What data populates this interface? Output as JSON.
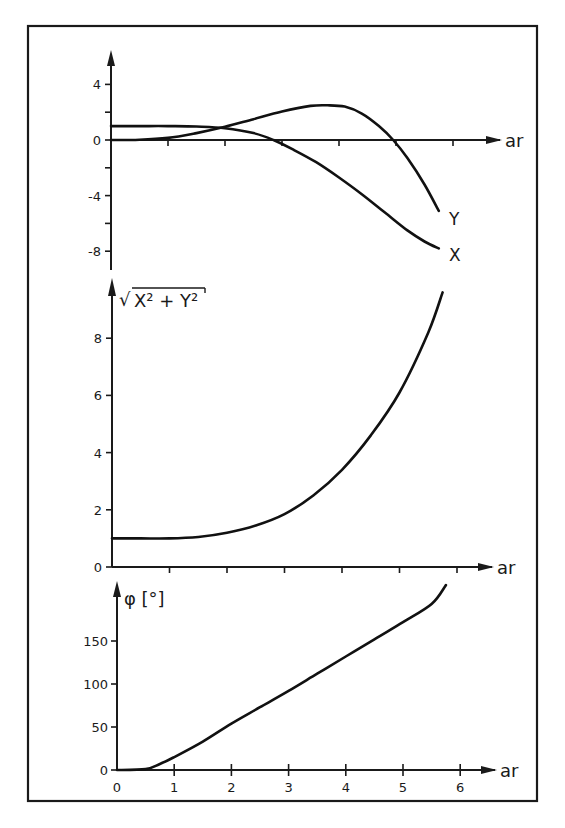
{
  "chart_data": [
    {
      "type": "line",
      "panel": "top",
      "title": "",
      "xlabel": "ar",
      "ylabel": "",
      "xlim": [
        0,
        6.5
      ],
      "ylim": [
        -9,
        5.5
      ],
      "x_ticks": [
        1,
        2,
        3,
        4,
        5,
        6
      ],
      "y_ticks": [
        4,
        2,
        0,
        -2,
        -4,
        -6,
        -8
      ],
      "y_tick_labels": [
        "4",
        "0",
        "-4",
        "-8"
      ],
      "grid": false,
      "series": [
        {
          "name": "X",
          "x": [
            0,
            0.5,
            1.0,
            1.5,
            2.0,
            2.5,
            2.85,
            3.2,
            3.6,
            4.0,
            4.4,
            4.8,
            5.2,
            5.5,
            5.75
          ],
          "values": [
            1.0,
            1.0,
            1.0,
            0.97,
            0.85,
            0.5,
            0.0,
            -0.7,
            -1.6,
            -2.7,
            -3.9,
            -5.2,
            -6.5,
            -7.3,
            -7.8
          ]
        },
        {
          "name": "Y",
          "x": [
            0,
            0.5,
            1.0,
            1.5,
            2.0,
            2.5,
            3.0,
            3.5,
            3.8,
            4.1,
            4.4,
            4.7,
            4.95,
            5.2,
            5.5,
            5.75
          ],
          "values": [
            0.0,
            0.02,
            0.15,
            0.5,
            0.95,
            1.5,
            2.05,
            2.45,
            2.5,
            2.4,
            1.9,
            1.0,
            0.0,
            -1.3,
            -3.2,
            -5.1
          ]
        }
      ]
    },
    {
      "type": "line",
      "panel": "middle",
      "title": "",
      "xlabel": "ar",
      "ylabel": "√(X² + Y²)",
      "xlim": [
        0,
        6.5
      ],
      "ylim": [
        0,
        10
      ],
      "x_ticks": [
        1,
        2,
        3,
        4,
        5,
        6
      ],
      "y_ticks": [
        0,
        2,
        4,
        6,
        8
      ],
      "grid": false,
      "series": [
        {
          "name": "sqrt(X^2+Y^2)",
          "x": [
            0,
            0.5,
            1.0,
            1.5,
            2.0,
            2.5,
            3.0,
            3.5,
            4.0,
            4.5,
            5.0,
            5.5,
            5.75
          ],
          "values": [
            1.0,
            1.0,
            1.0,
            1.05,
            1.2,
            1.45,
            1.85,
            2.5,
            3.4,
            4.6,
            6.1,
            8.2,
            9.6
          ]
        }
      ]
    },
    {
      "type": "line",
      "panel": "bottom",
      "title": "",
      "xlabel": "ar",
      "ylabel": "φ [°]",
      "xlim": [
        0,
        6.5
      ],
      "ylim": [
        0,
        225
      ],
      "x_ticks": [
        0,
        1,
        2,
        3,
        4,
        5,
        6
      ],
      "y_ticks": [
        0,
        50,
        100,
        150
      ],
      "grid": false,
      "series": [
        {
          "name": "phi",
          "x": [
            0,
            0.5,
            0.75,
            1.0,
            1.5,
            2.0,
            2.5,
            3.0,
            3.5,
            4.0,
            4.5,
            5.0,
            5.5,
            5.75
          ],
          "values": [
            0,
            1,
            7,
            15,
            33,
            54,
            73,
            92,
            112,
            132,
            152,
            172,
            193,
            215
          ]
        }
      ]
    }
  ],
  "labels": {
    "x_axis": "ar",
    "series_x": "X",
    "series_y": "Y",
    "middle_ylabel_radical": "√",
    "middle_ylabel_expr": "X² + Y²",
    "bottom_ylabel": "φ [°]",
    "x_tick_labels": [
      "0",
      "1",
      "2",
      "3",
      "4",
      "5",
      "6"
    ],
    "top_y_tick_labels": [
      "4",
      "0",
      "-4",
      "-8"
    ],
    "middle_y_tick_labels": [
      "8",
      "6",
      "4",
      "2",
      "0"
    ],
    "bottom_y_tick_labels": [
      "150",
      "100",
      "50",
      "0"
    ]
  },
  "colors": {
    "ink": "#1a1a1a",
    "background": "#ffffff"
  }
}
